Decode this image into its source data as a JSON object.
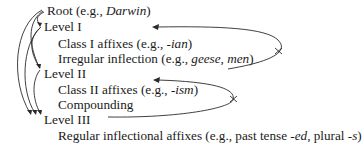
{
  "diagram": {
    "lines": [
      {
        "id": "root",
        "parts": [
          {
            "text": "Root (e.g., ",
            "italic": false
          },
          {
            "text": "Darwin",
            "italic": true
          },
          {
            "text": ")",
            "italic": false
          }
        ]
      },
      {
        "id": "level1",
        "parts": [
          {
            "text": "Level I",
            "italic": false
          }
        ]
      },
      {
        "id": "class1",
        "parts": [
          {
            "text": "Class I affixes (e.g., ",
            "italic": false
          },
          {
            "text": "-ian",
            "italic": true
          },
          {
            "text": ")",
            "italic": false
          }
        ]
      },
      {
        "id": "irregular",
        "parts": [
          {
            "text": "Irregular inflection (e.g., ",
            "italic": false
          },
          {
            "text": "geese, men",
            "italic": true
          },
          {
            "text": ")",
            "italic": false
          }
        ]
      },
      {
        "id": "level2",
        "parts": [
          {
            "text": "Level II",
            "italic": false
          }
        ]
      },
      {
        "id": "class2",
        "parts": [
          {
            "text": "Class II affixes (e.g., ",
            "italic": false
          },
          {
            "text": "-ism",
            "italic": true
          },
          {
            "text": ")",
            "italic": false
          }
        ]
      },
      {
        "id": "compounding",
        "parts": [
          {
            "text": "Compounding",
            "italic": false
          }
        ]
      },
      {
        "id": "level3",
        "parts": [
          {
            "text": "Level III",
            "italic": false
          }
        ]
      },
      {
        "id": "regular",
        "parts": [
          {
            "text": "Regular inflectional affixes (e.g., past tense ",
            "italic": false
          },
          {
            "text": "-ed",
            "italic": true
          },
          {
            "text": ", plural ",
            "italic": false
          },
          {
            "text": "-s",
            "italic": true
          },
          {
            "text": ")",
            "italic": false
          }
        ]
      }
    ],
    "arrows": [
      {
        "from": "root",
        "to": "level1",
        "type": "allowed"
      },
      {
        "from": "root",
        "to": "level2",
        "type": "allowed"
      },
      {
        "from": "root",
        "to": "level3",
        "type": "allowed"
      },
      {
        "from": "level1",
        "to": "level2",
        "type": "allowed"
      },
      {
        "from": "level1",
        "to": "level3",
        "type": "allowed"
      },
      {
        "from": "level2",
        "to": "level3",
        "type": "allowed"
      },
      {
        "from": "level2",
        "to": "level1",
        "type": "blocked"
      },
      {
        "from": "level3",
        "to": "level2",
        "type": "blocked"
      }
    ]
  }
}
